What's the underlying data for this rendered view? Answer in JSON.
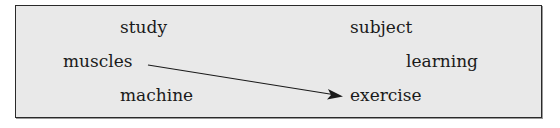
{
  "words": {
    "study": "study",
    "subject": "subject",
    "muscles": "muscles",
    "learning": "learning",
    "machine": "machine",
    "exercise": "exercise"
  },
  "arrow": {
    "from": "muscles",
    "to": "exercise",
    "color": "#1a1a1a"
  },
  "colors": {
    "box_background": "#e9e9e9",
    "border": "#2a2a2a",
    "text": "#1a1a1a"
  }
}
